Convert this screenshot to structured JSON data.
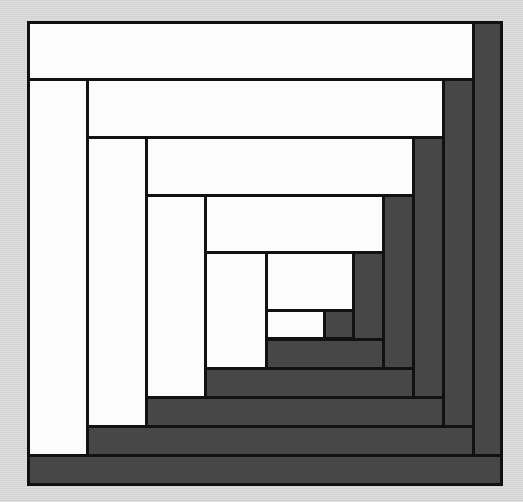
{
  "figure": {
    "name": "log-cabin-quilt-block",
    "colors": {
      "light": "#fcfcfc",
      "dark": "#474747",
      "line": "#111111",
      "background": "#d8d8d8"
    },
    "frame": {
      "x": 27,
      "y": 21,
      "w": 476,
      "h": 465
    },
    "pieces": [
      {
        "id": "center-light",
        "tone": "light",
        "x": 266,
        "y": 310,
        "w": 59,
        "h": 29
      },
      {
        "id": "center-dark",
        "tone": "dark",
        "x": 324,
        "y": 310,
        "w": 30,
        "h": 29
      },
      {
        "id": "r1-top",
        "tone": "light",
        "x": 266,
        "y": 252,
        "w": 88,
        "h": 59
      },
      {
        "id": "r1-right",
        "tone": "dark",
        "x": 353,
        "y": 252,
        "w": 31,
        "h": 88
      },
      {
        "id": "r1-bottom",
        "tone": "dark",
        "x": 266,
        "y": 339,
        "w": 118,
        "h": 30
      },
      {
        "id": "r1-left",
        "tone": "light",
        "x": 205,
        "y": 252,
        "w": 62,
        "h": 117
      },
      {
        "id": "r2-top",
        "tone": "light",
        "x": 205,
        "y": 195,
        "w": 179,
        "h": 58
      },
      {
        "id": "r2-right",
        "tone": "dark",
        "x": 383,
        "y": 195,
        "w": 31,
        "h": 174
      },
      {
        "id": "r2-bottom",
        "tone": "dark",
        "x": 205,
        "y": 368,
        "w": 209,
        "h": 30
      },
      {
        "id": "r2-left",
        "tone": "light",
        "x": 146,
        "y": 195,
        "w": 60,
        "h": 203
      },
      {
        "id": "r3-top",
        "tone": "light",
        "x": 146,
        "y": 137,
        "w": 268,
        "h": 59
      },
      {
        "id": "r3-right",
        "tone": "dark",
        "x": 413,
        "y": 137,
        "w": 31,
        "h": 261
      },
      {
        "id": "r3-bottom",
        "tone": "dark",
        "x": 146,
        "y": 397,
        "w": 298,
        "h": 30
      },
      {
        "id": "r3-left",
        "tone": "light",
        "x": 87,
        "y": 137,
        "w": 60,
        "h": 290
      },
      {
        "id": "r4-top",
        "tone": "light",
        "x": 87,
        "y": 79,
        "w": 357,
        "h": 59
      },
      {
        "id": "r4-right",
        "tone": "dark",
        "x": 443,
        "y": 79,
        "w": 31,
        "h": 348
      },
      {
        "id": "r4-bottom",
        "tone": "dark",
        "x": 87,
        "y": 426,
        "w": 387,
        "h": 30
      },
      {
        "id": "r4-left",
        "tone": "light",
        "x": 27,
        "y": 79,
        "w": 61,
        "h": 377
      },
      {
        "id": "r5-top",
        "tone": "light",
        "x": 27,
        "y": 21,
        "w": 447,
        "h": 59
      },
      {
        "id": "r5-right",
        "tone": "dark",
        "x": 473,
        "y": 21,
        "w": 30,
        "h": 435
      },
      {
        "id": "r5-bottom",
        "tone": "dark",
        "x": 27,
        "y": 455,
        "w": 476,
        "h": 31
      }
    ]
  }
}
